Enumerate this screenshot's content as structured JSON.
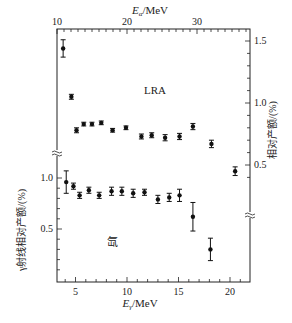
{
  "chart_data": {
    "type": "scatter",
    "title": "",
    "top_axis": {
      "label": "Eα/MeV",
      "ticks": [
        10,
        20,
        30
      ],
      "range": [
        10,
        37.6
      ]
    },
    "bottom_axis": {
      "label": "Eγ/MeV",
      "ticks": [
        5,
        10,
        15,
        20
      ],
      "range": [
        3.2,
        21.9
      ]
    },
    "left_axis": {
      "label": "γ射线相对产额/(%)",
      "ticks": [
        0.5,
        1.0
      ],
      "range": [
        0.0,
        1.02
      ],
      "break": true
    },
    "right_axis": {
      "label": "相对产额/(%)",
      "ticks": [
        0.5,
        1.0,
        1.5
      ],
      "range": [
        0.3,
        1.56
      ],
      "break": true
    },
    "grid": false,
    "annotations": [
      "LRA",
      "氙"
    ],
    "series": [
      {
        "name": "LRA",
        "axis": "right",
        "x": [
          3.8,
          4.6,
          5.1,
          5.8,
          6.6,
          7.5,
          8.6,
          9.9,
          11.4,
          12.4,
          13.7,
          15.1,
          16.4,
          18.2,
          20.5
        ],
        "y": [
          1.44,
          1.05,
          0.78,
          0.83,
          0.83,
          0.84,
          0.78,
          0.8,
          0.73,
          0.74,
          0.72,
          0.73,
          0.81,
          0.67,
          0.45
        ],
        "yerr": [
          0.07,
          0.02,
          0.02,
          0.015,
          0.015,
          0.015,
          0.015,
          0.015,
          0.02,
          0.02,
          0.025,
          0.025,
          0.025,
          0.03,
          0.035
        ]
      },
      {
        "name": "氙",
        "axis": "left",
        "x": [
          4.1,
          4.8,
          5.4,
          6.3,
          7.3,
          8.5,
          9.5,
          10.6,
          11.7,
          13.0,
          14.1,
          15.1,
          16.4,
          18.1
        ],
        "y": [
          0.96,
          0.92,
          0.83,
          0.88,
          0.83,
          0.87,
          0.87,
          0.85,
          0.86,
          0.79,
          0.81,
          0.83,
          0.62,
          0.3
        ],
        "yerr": [
          0.11,
          0.03,
          0.03,
          0.03,
          0.03,
          0.04,
          0.04,
          0.04,
          0.03,
          0.04,
          0.04,
          0.06,
          0.14,
          0.11
        ]
      }
    ]
  },
  "labels": {
    "top_axis": "Eα/MeV",
    "bottom_axis": "Eγ/MeV",
    "left_axis": "γ射线相对产额/(%)",
    "right_axis": "相对产额/(%)",
    "lra": "LRA",
    "xenon": "氙"
  }
}
